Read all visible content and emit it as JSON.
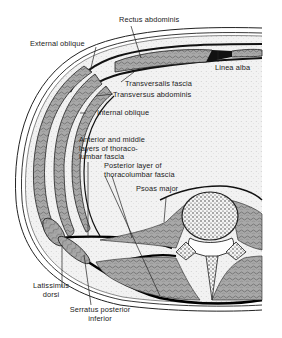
{
  "figure": {
    "type": "anatomical cross-section diagram",
    "colors": {
      "ink": "#1a1a1a",
      "muscle_fill": "#9a9a9a",
      "fat_fill": "#ececec",
      "background": "#ffffff"
    }
  },
  "labels": {
    "rectus_abdominis": "Rectus abdominis",
    "external_oblique": "External oblique",
    "linea_alba": "Linea alba",
    "transversalis_fascia": "Transversalis fascia",
    "transversus_abdominis": "Transversus abdominis",
    "internal_oblique": "Internal oblique",
    "anterior_middle_layers": [
      "Anterior and middle",
      "layers  of thoraco-",
      "lumbar fascia"
    ],
    "posterior_layer": [
      "Posterior layer of",
      "thoracolumbar fascia"
    ],
    "psoas_major": "Psoas major",
    "latissimus_dorsi": [
      "Latissimus",
      "dorsi"
    ],
    "serratus_posterior_inferior": [
      "Serratus posterior",
      "inferior"
    ]
  }
}
